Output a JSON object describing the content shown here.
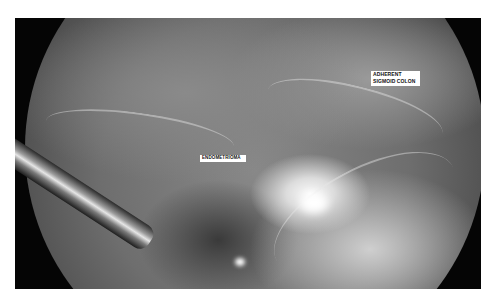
{
  "figure": {
    "type": "laparoscopic-photograph",
    "labels": {
      "sigmoid_line1": "ADHERENT",
      "sigmoid_line2": "SIGMOID COLON",
      "endometrioma": "ENDOMETRIOMA"
    }
  }
}
